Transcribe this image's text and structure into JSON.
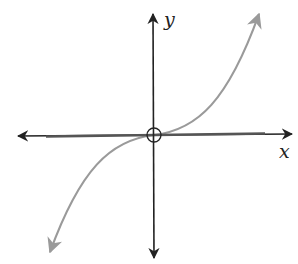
{
  "diagram": {
    "type": "function-graph",
    "function": "cubic (y = x^3 shape)",
    "x_axis_label": "x",
    "y_axis_label": "y",
    "origin_marker": "open circle at origin",
    "tangent_line": "horizontal line along x-axis at origin",
    "colors": {
      "axes": "#222222",
      "curve": "#9a9a9a",
      "tangent": "#555555"
    }
  }
}
